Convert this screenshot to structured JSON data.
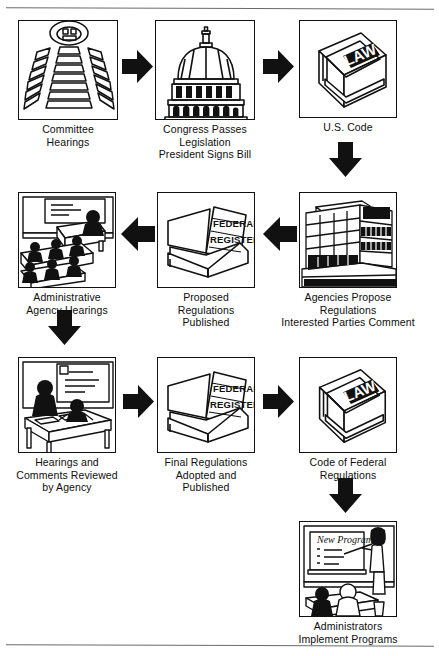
{
  "document": {
    "title": "How a Law Becomes a Regulation",
    "ink_color": "#111111",
    "paper_color": "#ffffff",
    "rule_color": "#6a6a6a"
  },
  "nodes": [
    {
      "id": "committee-hearings",
      "icon": "amphitheater-hearing-room-icon",
      "caption": "Committee\nHearings",
      "x": 18,
      "y": 20,
      "panel_w": 100,
      "panel_h": 100
    },
    {
      "id": "congress-passes-legislation",
      "icon": "capitol-dome-icon",
      "caption": "Congress Passes\nLegislation\nPresident Signs Bill",
      "x": 155,
      "y": 20,
      "panel_w": 100,
      "panel_h": 100
    },
    {
      "id": "us-code",
      "icon": "law-book-icon",
      "icon_text": "LAW",
      "caption": "U.S. Code",
      "x": 299,
      "y": 20,
      "panel_w": 98,
      "panel_h": 98
    },
    {
      "id": "administrative-agency-hearings",
      "icon": "hearing-room-audience-icon",
      "caption": "Administrative\nAgency Hearings",
      "x": 18,
      "y": 192,
      "panel_w": 98,
      "panel_h": 96
    },
    {
      "id": "proposed-regulations-published",
      "icon": "open-federal-register-book-icon",
      "icon_text": "FEDERAL REGISTER",
      "caption": "Proposed Regulations\nPublished",
      "x": 157,
      "y": 192,
      "panel_w": 98,
      "panel_h": 96
    },
    {
      "id": "agencies-propose-regulations",
      "icon": "agency-office-building-icon",
      "caption": "Agencies Propose\nRegulations\nInterested Parties Comment",
      "x": 299,
      "y": 192,
      "panel_w": 98,
      "panel_h": 96
    },
    {
      "id": "hearings-comments-reviewed",
      "icon": "agency-staff-reviewing-desk-icon",
      "caption": "Hearings and\nComments Reviewed\nby Agency",
      "x": 18,
      "y": 357,
      "panel_w": 98,
      "panel_h": 96
    },
    {
      "id": "final-regulations-adopted",
      "icon": "open-federal-register-book-icon",
      "icon_text": "FEDERAL REGISTER",
      "caption": "Final Regulations\nAdopted and\nPublished",
      "x": 157,
      "y": 357,
      "panel_w": 98,
      "panel_h": 96
    },
    {
      "id": "code-of-federal-regulations",
      "icon": "law-book-icon",
      "icon_text": "LAW",
      "caption": "Code of Federal\nRegulations",
      "x": 299,
      "y": 357,
      "panel_w": 98,
      "panel_h": 96
    },
    {
      "id": "administrators-implement-programs",
      "icon": "classroom-presentation-icon",
      "icon_text": "New Program",
      "caption": "Administrators\nImplement Programs",
      "x": 299,
      "y": 521,
      "panel_w": 98,
      "panel_h": 96
    }
  ],
  "arrows": [
    {
      "id": "arrow-committee-to-congress",
      "direction": "right",
      "x": 121,
      "y": 48
    },
    {
      "id": "arrow-congress-to-uscode",
      "direction": "right",
      "x": 262,
      "y": 48
    },
    {
      "id": "arrow-uscode-to-agencies",
      "direction": "down",
      "x": 327,
      "y": 141
    },
    {
      "id": "arrow-agencies-to-proposed",
      "direction": "left",
      "x": 262,
      "y": 215
    },
    {
      "id": "arrow-proposed-to-hearings",
      "direction": "left",
      "x": 120,
      "y": 215
    },
    {
      "id": "arrow-hearings-to-review",
      "direction": "down",
      "x": 46,
      "y": 309
    },
    {
      "id": "arrow-review-to-final",
      "direction": "right",
      "x": 122,
      "y": 383
    },
    {
      "id": "arrow-final-to-cfr",
      "direction": "right",
      "x": 262,
      "y": 383
    },
    {
      "id": "arrow-cfr-to-administrators",
      "direction": "down",
      "x": 327,
      "y": 477
    }
  ]
}
